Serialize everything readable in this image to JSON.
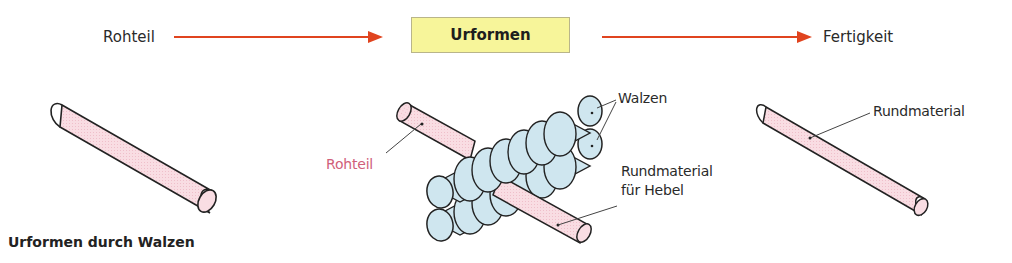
{
  "flow": {
    "input_label": "Rohteil",
    "process_label": "Urformen",
    "output_label": "Fertigkeit",
    "arrow_color": "#e0441f",
    "process_box_color": "#f7f59a"
  },
  "illustrations": {
    "left": {
      "description": "raw round bar"
    },
    "center": {
      "labels": {
        "rolls": "Walzen",
        "raw_part": "Rohteil",
        "product_line1": "Rundmaterial",
        "product_line2": "für Hebel"
      }
    },
    "right": {
      "labels": {
        "product": "Rundmaterial"
      }
    }
  },
  "colors": {
    "bar_fill": "#f7d5dc",
    "roll_fill": "#cfe6ef",
    "raw_label": "#d0607a"
  },
  "caption": "Urformen durch Walzen"
}
